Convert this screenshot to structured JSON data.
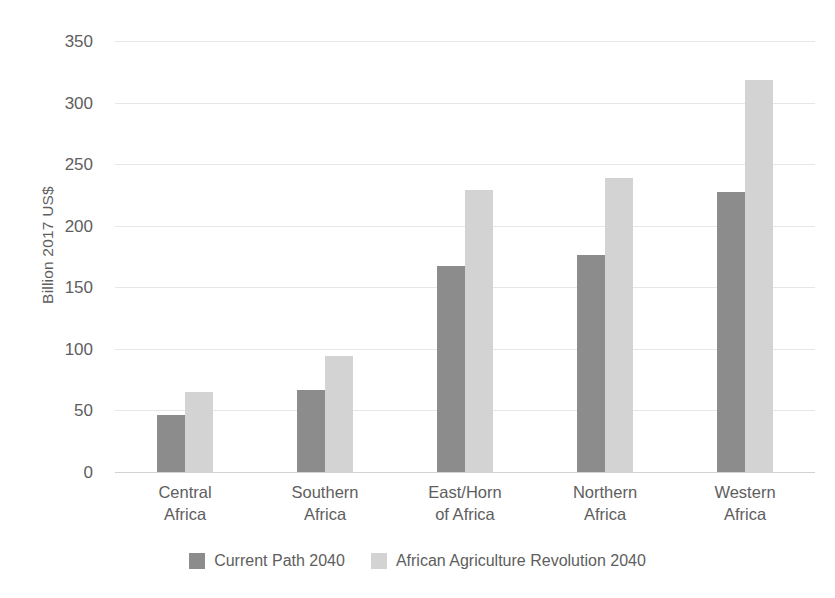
{
  "chart_data": {
    "type": "bar",
    "title": "",
    "subtitle": "",
    "xlabel": "",
    "ylabel": "Billion 2017 US$",
    "ylim": [
      0,
      350
    ],
    "ytick_step": 50,
    "yticks": [
      350,
      300,
      250,
      200,
      150,
      100,
      50,
      0
    ],
    "ytick_labels": [
      "350",
      "300",
      "250",
      "200",
      "150",
      "100",
      "50",
      "0"
    ],
    "grid": true,
    "grid_axis": "y",
    "legend_position": "bottom",
    "categories": [
      "Central Africa",
      "Southern Africa",
      "East/Horn of Africa",
      "Northern Africa",
      "Western Africa"
    ],
    "category_lines": [
      [
        "Central",
        "Africa"
      ],
      [
        "Southern",
        "Africa"
      ],
      [
        "East/Horn",
        "of Africa"
      ],
      [
        "Northern",
        "Africa"
      ],
      [
        "Western",
        "Africa"
      ]
    ],
    "series": [
      {
        "name": "Current Path 2040",
        "color": "#8c8c8c",
        "values": [
          46,
          67,
          167,
          176,
          227
        ]
      },
      {
        "name": "African Agriculture Revolution 2040",
        "color": "#d3d3d3",
        "values": [
          65,
          94,
          229,
          239,
          318
        ]
      }
    ]
  },
  "legend": {
    "items": [
      {
        "label": "Current Path 2040",
        "swatch": "dark-gray-swatch"
      },
      {
        "label": "African Agriculture Revolution 2040",
        "swatch": "light-gray-swatch"
      }
    ]
  },
  "colors": {
    "series_dark": "#8c8c8c",
    "series_light": "#d3d3d3",
    "gridline": "#e7e7e7",
    "baseline": "#d2d2d2",
    "text": "#5e5e5e",
    "background": "#ffffff"
  }
}
